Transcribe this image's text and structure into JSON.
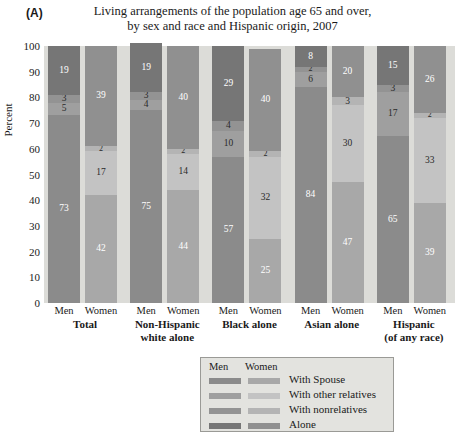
{
  "panel_letter": "(A)",
  "title": {
    "line1": "Living arrangements of the population age 65 and over,",
    "line2": "by sex and race and Hispanic origin, 2007"
  },
  "axis": {
    "ylabel": "Percent",
    "yticks": [
      "0",
      "10",
      "20",
      "30",
      "40",
      "50",
      "60",
      "70",
      "80",
      "90",
      "100"
    ],
    "ymin": 0,
    "ymax": 100
  },
  "legend": {
    "header_men": "Men",
    "header_women": "Women",
    "entries": [
      {
        "label": "With Spouse",
        "men_color": "#8b8b8b",
        "women_color": "#a8a8a8"
      },
      {
        "label": "With other relatives",
        "men_color": "#9f9f9f",
        "women_color": "#c3c3c3"
      },
      {
        "label": "With nonrelatives",
        "men_color": "#939393",
        "women_color": "#b4b4b4"
      },
      {
        "label": "Alone",
        "men_color": "#767676",
        "women_color": "#909090"
      }
    ]
  },
  "sex_labels": {
    "men": "Men",
    "women": "Women"
  },
  "chart_data": {
    "type": "bar",
    "subtype": "stacked-100",
    "title": "Living arrangements of the population age 65 and over, by sex and race and Hispanic origin, 2007",
    "xlabel": "",
    "ylabel": "Percent",
    "ylim": [
      0,
      100
    ],
    "grid": false,
    "legend_position": "below-center",
    "categories": [
      "Total",
      "Non-Hispanic white alone",
      "Black alone",
      "Asian alone",
      "Hispanic (of any race)"
    ],
    "category_lines": [
      [
        "Total"
      ],
      [
        "Non-Hispanic",
        "white alone"
      ],
      [
        "Black alone"
      ],
      [
        "Asian alone"
      ],
      [
        "Hispanic",
        "(of any race)"
      ]
    ],
    "stack_order_bottom_to_top": [
      "With Spouse",
      "With other relatives",
      "With nonrelatives",
      "Alone"
    ],
    "series": [
      {
        "name": "With Spouse",
        "men_color": "#8b8b8b",
        "women_color": "#a8a8a8",
        "men": [
          73,
          75,
          57,
          84,
          65
        ],
        "women": [
          42,
          44,
          25,
          47,
          39
        ]
      },
      {
        "name": "With other relatives",
        "men_color": "#9f9f9f",
        "women_color": "#c3c3c3",
        "men": [
          5,
          4,
          10,
          6,
          17
        ],
        "women": [
          17,
          14,
          32,
          30,
          33
        ]
      },
      {
        "name": "With nonrelatives",
        "men_color": "#939393",
        "women_color": "#b4b4b4",
        "men": [
          3,
          3,
          4,
          2,
          3
        ],
        "women": [
          2,
          2,
          2,
          3,
          2
        ]
      },
      {
        "name": "Alone",
        "men_color": "#767676",
        "women_color": "#909090",
        "men": [
          19,
          19,
          29,
          8,
          15
        ],
        "women": [
          39,
          40,
          40,
          20,
          26
        ]
      }
    ]
  },
  "colors": {
    "plot_background": "#dcdcd8",
    "legend_background": "#e3e3df",
    "legend_border": "#9a9a96",
    "page_background": "#ffffff",
    "bar_label_light": "#ffffff",
    "bar_label_dark": "#2a2a2a"
  }
}
